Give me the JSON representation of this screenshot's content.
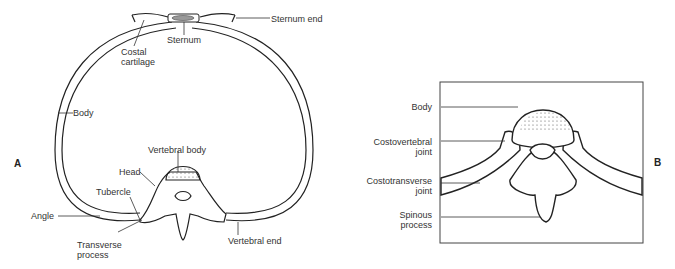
{
  "panel_a": {
    "letter": "A",
    "labels": {
      "sternum_end": "Sternum end",
      "sternum": "Sternum",
      "costal_cartilage_1": "Costal",
      "costal_cartilage_2": "cartilage",
      "body": "Body",
      "vertebral_body": "Vertebral body",
      "head": "Head",
      "tubercle": "Tubercle",
      "angle": "Angle",
      "transverse_process_1": "Transverse",
      "transverse_process_2": "process",
      "vertebral_end": "Vertebral end"
    }
  },
  "panel_b": {
    "letter": "B",
    "labels": {
      "body": "Body",
      "costovertebral_1": "Costovertebral",
      "costovertebral_2": "joint",
      "costotransverse_1": "Costotransverse",
      "costotransverse_2": "joint",
      "spinous_1": "Spinous",
      "spinous_2": "process"
    }
  }
}
